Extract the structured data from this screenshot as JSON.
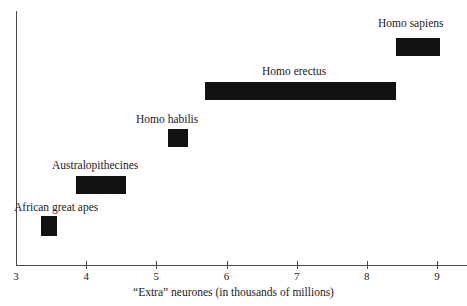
{
  "chart_data": {
    "type": "bar",
    "orientation": "horizontal-range",
    "title": "",
    "subtitle": "",
    "xlabel": "“Extra” neurones (in thousands of millions)",
    "ylabel": "",
    "xlim": [
      3,
      9
    ],
    "xticks": [
      "3",
      "4",
      "5",
      "6",
      "7",
      "8",
      "9"
    ],
    "grid": false,
    "legend": "none",
    "annotations": "Each black bar is a range of “extra” neurones for the named hominid group; labels sit directly above each bar.",
    "categories": [
      "African great apes",
      "Australopithecines",
      "Homo habilis",
      "Homo erectus",
      "Homo sapiens"
    ],
    "bars": [
      {
        "label": "African great apes",
        "x_start": 3.36,
        "x_end": 3.58,
        "row": 0,
        "label_align": "left"
      },
      {
        "label": "Australopithecines",
        "x_start": 3.85,
        "x_end": 4.57,
        "row": 1,
        "label_align": "center"
      },
      {
        "label": "Homo habilis",
        "x_start": 5.17,
        "x_end": 5.45,
        "row": 2,
        "label_align": "center"
      },
      {
        "label": "Homo erectus",
        "x_start": 5.69,
        "x_end": 8.41,
        "row": 3,
        "label_align": "center"
      },
      {
        "label": "Homo sapiens",
        "x_start": 8.41,
        "x_end": 9.04,
        "row": 4,
        "label_align": "center"
      }
    ],
    "bar_color": "#121212",
    "axis_color": "#4a4a4a",
    "text_color": "#1a1a1a",
    "background_color": "#ffffff"
  },
  "geometry": {
    "axis_x_px_at_3": 16,
    "axis_px_per_unit": 70.17,
    "bar_rows_top_px": [
      216,
      176,
      129,
      82,
      38
    ],
    "bar_height_px": [
      20,
      18,
      18,
      18,
      18
    ],
    "label_top_px": [
      200,
      158,
      112,
      64,
      16
    ],
    "label_left_px": [
      14,
      52,
      136,
      262,
      378
    ]
  }
}
